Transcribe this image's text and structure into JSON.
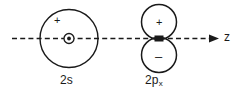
{
  "figure": {
    "background_color": "#ffffff",
    "stroke_color": "#1a1a1a",
    "axis": {
      "name": "z-axis",
      "label": "z",
      "style": "dashed with right arrowhead",
      "y": 38,
      "x_start": 12,
      "x_end": 218
    },
    "orbitals": [
      {
        "key": "2s",
        "label_text": "2s",
        "label_main": "2s",
        "label_sub": "",
        "type": "s-orbital",
        "center": {
          "x": 69,
          "y": 38
        },
        "outer_radius": 29,
        "nucleus": {
          "shape": "circle-with-dot",
          "radius": 5
        },
        "lobes": [
          {
            "sign": "+",
            "position": "inside-upper-left"
          }
        ]
      },
      {
        "key": "2px",
        "label_text": "2px",
        "label_main": "2p",
        "label_sub": "x",
        "type": "p-orbital",
        "center": {
          "x": 159,
          "y": 38
        },
        "lobe_radius": 18,
        "nucleus": {
          "shape": "filled-rectangle",
          "width": 9,
          "height": 6
        },
        "lobes": [
          {
            "sign": "+",
            "position": "upper"
          },
          {
            "sign": "–",
            "position": "lower"
          }
        ]
      }
    ]
  }
}
